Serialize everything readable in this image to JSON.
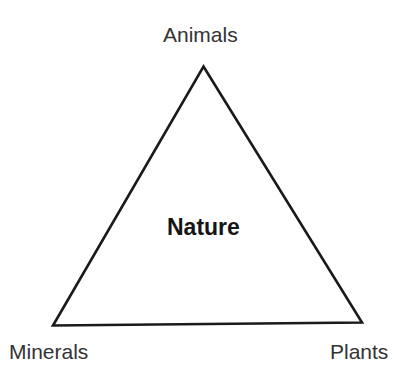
{
  "diagram": {
    "type": "triangle-relationship-diagram",
    "background_color": "#ffffff",
    "stroke_color": "#1a1a1a",
    "center": {
      "label": "Nature",
      "color": "#151515"
    },
    "vertices": [
      {
        "id": "top",
        "label": "Animals",
        "color": "#333333"
      },
      {
        "id": "bottom-left",
        "label": "Minerals",
        "color": "#333333"
      },
      {
        "id": "bottom-right",
        "label": "Plants",
        "color": "#333333"
      }
    ]
  }
}
